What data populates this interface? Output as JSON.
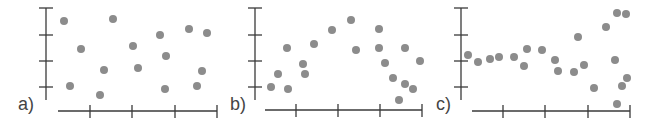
{
  "colors": {
    "axis": "#3a3a3a",
    "point": "#8c8c8c"
  },
  "chart_data": [
    {
      "type": "scatter",
      "title": "",
      "panel_label": "a)",
      "xlabel": "",
      "ylabel": "",
      "grid": false,
      "pattern": "no correlation (random scatter)",
      "x_ticks": 4,
      "y_ticks": 4,
      "frame": {
        "yaxis_x": 46,
        "yaxis_top": 8,
        "yaxis_bottom": 100,
        "ytick_ys": [
          8,
          35,
          61,
          87
        ],
        "xaxis_y": 111,
        "xaxis_left": 58,
        "xaxis_right": 217,
        "xtick_xs": [
          90,
          132,
          175,
          217
        ],
        "label_x": 18,
        "label_y": 94
      },
      "points": [
        [
          64,
          21
        ],
        [
          81,
          49
        ],
        [
          70,
          86
        ],
        [
          104,
          70
        ],
        [
          100,
          95
        ],
        [
          113,
          19
        ],
        [
          133,
          46
        ],
        [
          138,
          68
        ],
        [
          160,
          35
        ],
        [
          166,
          56
        ],
        [
          165,
          89
        ],
        [
          189,
          29
        ],
        [
          197,
          86
        ],
        [
          202,
          71
        ],
        [
          207,
          33
        ]
      ]
    },
    {
      "type": "scatter",
      "title": "",
      "panel_label": "b)",
      "xlabel": "",
      "ylabel": "",
      "grid": false,
      "pattern": "nonlinear (rise then fall)",
      "x_ticks": 4,
      "y_ticks": 4,
      "frame": {
        "yaxis_x": 255,
        "yaxis_top": 8,
        "yaxis_bottom": 100,
        "ytick_ys": [
          8,
          35,
          61,
          87
        ],
        "xaxis_y": 110,
        "xaxis_left": 265,
        "xaxis_right": 422,
        "xtick_xs": [
          296,
          338,
          380,
          422
        ],
        "label_x": 230,
        "label_y": 94
      },
      "points": [
        [
          271,
          87
        ],
        [
          278,
          74
        ],
        [
          287,
          48
        ],
        [
          288,
          89
        ],
        [
          303,
          64
        ],
        [
          305,
          74
        ],
        [
          314,
          44
        ],
        [
          332,
          30
        ],
        [
          351,
          20
        ],
        [
          356,
          50
        ],
        [
          379,
          29
        ],
        [
          379,
          48
        ],
        [
          385,
          63
        ],
        [
          393,
          78
        ],
        [
          405,
          48
        ],
        [
          405,
          84
        ],
        [
          399,
          100
        ],
        [
          413,
          89
        ],
        [
          420,
          61
        ]
      ]
    },
    {
      "type": "scatter",
      "title": "",
      "panel_label": "c)",
      "xlabel": "",
      "ylabel": "",
      "grid": false,
      "pattern": "increasing spread (heteroscedastic)",
      "x_ticks": 4,
      "y_ticks": 4,
      "frame": {
        "yaxis_x": 461,
        "yaxis_top": 8,
        "yaxis_bottom": 100,
        "ytick_ys": [
          8,
          35,
          61,
          87
        ],
        "xaxis_y": 111,
        "xaxis_left": 472,
        "xaxis_right": 630,
        "xtick_xs": [
          503,
          545,
          588,
          630
        ],
        "label_x": 436,
        "label_y": 94
      },
      "points": [
        [
          468,
          55
        ],
        [
          478,
          62
        ],
        [
          490,
          59
        ],
        [
          499,
          57
        ],
        [
          514,
          57
        ],
        [
          524,
          66
        ],
        [
          527,
          49
        ],
        [
          542,
          50
        ],
        [
          555,
          60
        ],
        [
          558,
          71
        ],
        [
          574,
          72
        ],
        [
          578,
          37
        ],
        [
          584,
          65
        ],
        [
          594,
          88
        ],
        [
          606,
          27
        ],
        [
          617,
          13
        ],
        [
          626,
          14
        ],
        [
          615,
          60
        ],
        [
          627,
          78
        ],
        [
          622,
          86
        ],
        [
          617,
          104
        ]
      ]
    }
  ]
}
